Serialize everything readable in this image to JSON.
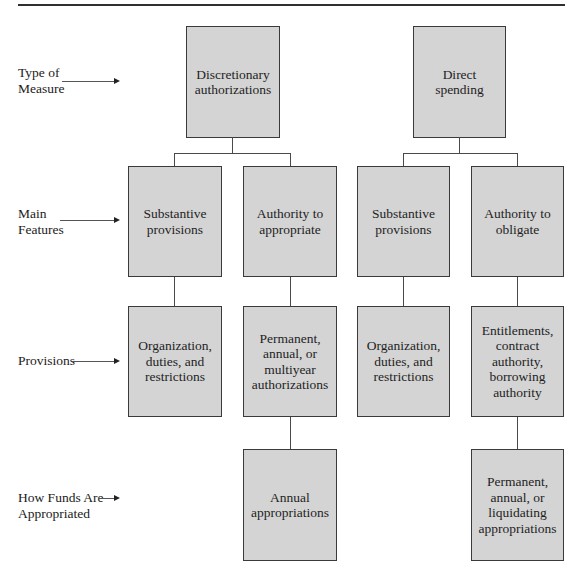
{
  "diagram": {
    "row_labels": [
      {
        "text": "Type of\nMeasure"
      },
      {
        "text": "Main\nFeatures"
      },
      {
        "text": "Provisions"
      },
      {
        "text": "How Funds Are\nAppropriated"
      }
    ],
    "nodes": {
      "discretionary": "Discretionary\nauthorizations",
      "direct_spending": "Direct\nspending",
      "disc_substantive": "Substantive\nprovisions",
      "disc_authority": "Authority to\nappropriate",
      "direct_substantive": "Substantive\nprovisions",
      "direct_authority": "Authority to\nobligate",
      "disc_org": "Organization,\nduties, and\nrestrictions",
      "disc_perm": "Permanent,\nannual, or\nmultiyear\nauthorizations",
      "direct_org": "Organization,\nduties, and\nrestrictions",
      "direct_entitlements": "Entitlements,\ncontract\nauthority,\nborrowing\nauthority",
      "disc_annual": "Annual\nappropriations",
      "direct_perm": "Permanent,\nannual, or\nliquidating\nappropriations"
    },
    "colors": {
      "box_fill": "#d4d4d4",
      "box_border": "#3a3a3a",
      "connector": "#4a4a4a"
    }
  }
}
